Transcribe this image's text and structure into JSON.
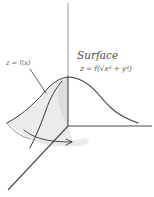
{
  "diagram": {
    "type": "surface-of-revolution sketch",
    "labels": {
      "surface_title": "Surface",
      "surface_equation": "z = f(√x² + y²)",
      "curve_equation": "z = f(x)"
    },
    "elements": [
      {
        "id": "z-axis",
        "kind": "axis",
        "direction": "vertical"
      },
      {
        "id": "y-axis",
        "kind": "axis",
        "direction": "horizontal-right"
      },
      {
        "id": "x-axis",
        "kind": "axis",
        "direction": "diagonal-down-left"
      },
      {
        "id": "profile-curve",
        "kind": "curve",
        "label": "z = f(x)"
      },
      {
        "id": "bell-surface",
        "kind": "surface",
        "label": "Surface"
      },
      {
        "id": "rotation-arrow",
        "kind": "arrow",
        "meaning": "rotation about z-axis"
      }
    ],
    "colors": {
      "ink": "#3a3a3a",
      "shading": "#d8d8d8",
      "background": "#ffffff"
    }
  }
}
